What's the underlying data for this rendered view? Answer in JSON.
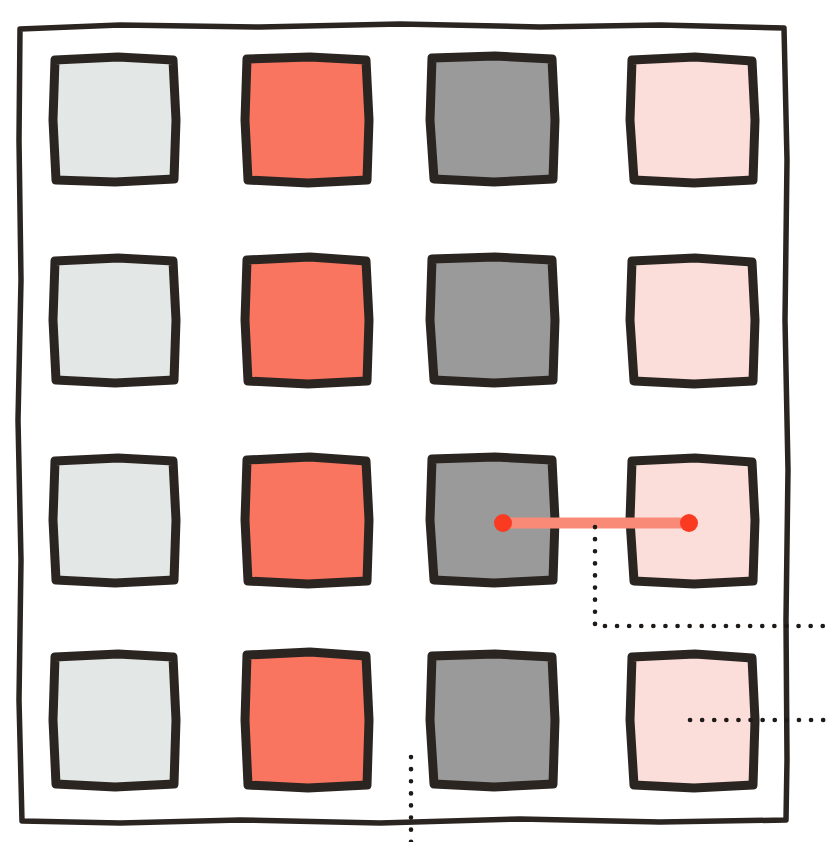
{
  "canvas": {
    "width": 830,
    "height": 842,
    "background": "#ffffff"
  },
  "figure": {
    "style": "hand-drawn sketch",
    "ink_color": "#2B2522",
    "frame": {
      "name": "outer-frame",
      "x": 18,
      "y": 24,
      "width": 770,
      "height": 798,
      "stroke": "#2B2522",
      "stroke_width": 5.5
    },
    "grid": {
      "rows": 4,
      "columns": 4,
      "column_x": [
        53,
        245,
        430,
        630
      ],
      "row_y": [
        57,
        258,
        458,
        653
      ],
      "cell_width": 124,
      "cell_height": 124,
      "cell_height_last_row": 132,
      "border_color": "#2B2522",
      "border_width": 9
    },
    "columns": [
      {
        "index": 0,
        "name": "column-light-gray",
        "fill": "#E3E8E6",
        "label": "light gray"
      },
      {
        "index": 1,
        "name": "column-coral",
        "fill": "#FA7560",
        "label": "coral"
      },
      {
        "index": 2,
        "name": "column-medium-gray",
        "fill": "#9A9A9A",
        "label": "medium gray"
      },
      {
        "index": 3,
        "name": "column-pale-pink",
        "fill": "#FBDEDA",
        "label": "pale pink"
      }
    ],
    "cells": [
      {
        "row": 0,
        "col": 0,
        "fill": "#E3E8E6"
      },
      {
        "row": 0,
        "col": 1,
        "fill": "#FA7560"
      },
      {
        "row": 0,
        "col": 2,
        "fill": "#9A9A9A"
      },
      {
        "row": 0,
        "col": 3,
        "fill": "#FBDEDA"
      },
      {
        "row": 1,
        "col": 0,
        "fill": "#E3E8E6"
      },
      {
        "row": 1,
        "col": 1,
        "fill": "#FA7560"
      },
      {
        "row": 1,
        "col": 2,
        "fill": "#9A9A9A"
      },
      {
        "row": 1,
        "col": 3,
        "fill": "#FBDEDA"
      },
      {
        "row": 2,
        "col": 0,
        "fill": "#E3E8E6"
      },
      {
        "row": 2,
        "col": 1,
        "fill": "#FA7560"
      },
      {
        "row": 2,
        "col": 2,
        "fill": "#9A9A9A"
      },
      {
        "row": 2,
        "col": 3,
        "fill": "#FBDEDA"
      },
      {
        "row": 3,
        "col": 0,
        "fill": "#E3E8E6"
      },
      {
        "row": 3,
        "col": 1,
        "fill": "#FA7560"
      },
      {
        "row": 3,
        "col": 2,
        "fill": "#9A9A9A"
      },
      {
        "row": 3,
        "col": 3,
        "fill": "#FBDEDA"
      }
    ],
    "connector": {
      "name": "pair-connector",
      "from": {
        "row": 2,
        "col": 2,
        "x": 503,
        "y": 523
      },
      "to": {
        "row": 2,
        "col": 3,
        "x": 689,
        "y": 523
      },
      "line_color": "#F98A78",
      "line_width": 11,
      "endpoint_color": "#FA3B21",
      "endpoint_radius": 9
    },
    "callouts": [
      {
        "name": "callout-upper",
        "shape": "elbow",
        "points": "595,527 595,626 830,626",
        "dash_color": "#1E1A18"
      },
      {
        "name": "callout-lower",
        "shape": "horizontal",
        "points": "690,720 830,720",
        "dash_color": "#1E1A18"
      },
      {
        "name": "callout-bottom",
        "shape": "vertical",
        "points": "411,757 411,842",
        "dash_color": "#1E1A18"
      }
    ]
  }
}
